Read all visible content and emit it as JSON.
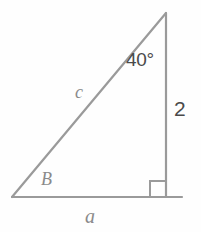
{
  "figure": {
    "type": "right-triangle-diagram",
    "background_color": "#fefefe",
    "stroke_color": "#9a9a9a",
    "stroke_width": 2
  },
  "geometry": {
    "vertices": {
      "bottom_left": {
        "x": 12,
        "y": 197
      },
      "bottom_right": {
        "x": 166,
        "y": 197
      },
      "top": {
        "x": 166,
        "y": 13
      }
    },
    "base_extension_x": 182,
    "right_angle_marker": {
      "x": 150,
      "y": 181,
      "size": 16
    }
  },
  "labels": {
    "angle_top": {
      "text": "40°",
      "color": "#4a4a4a",
      "style": "upright"
    },
    "side_vertical": {
      "text": "2",
      "color": "#4a4a4a",
      "style": "upright"
    },
    "side_hypotenuse": {
      "text": "c",
      "color": "#8a8a8a",
      "style": "italic"
    },
    "angle_bottom_left": {
      "text": "B",
      "color": "#8a8a8a",
      "style": "italic"
    },
    "side_base": {
      "text": "a",
      "color": "#8a8a8a",
      "style": "italic"
    }
  }
}
